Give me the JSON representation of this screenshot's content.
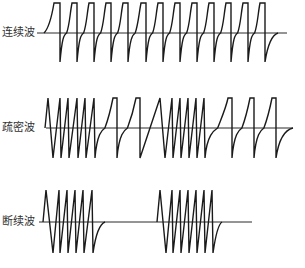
{
  "diagram": {
    "colors": {
      "line": "#1a1a1a",
      "baseline": "#2a2a2a",
      "label": "#333333",
      "background": "#ffffff"
    },
    "waveforms": [
      {
        "id": "continuous",
        "label": "连续波",
        "label_y": 27,
        "baseline": {
          "y": 33,
          "x_start": 37,
          "x_end": 287
        },
        "top": 3,
        "bottom": 62,
        "segments": [
          {
            "type": "lead_rise",
            "x0": 44,
            "x1": 54
          },
          {
            "type": "sparse",
            "drops": [
              60,
              77,
              94,
              111,
              128,
              146,
              163,
              180,
              197,
              214,
              231,
              248,
              265
            ],
            "flat": 5
          },
          {
            "type": "tail",
            "x_end": 278
          }
        ]
      },
      {
        "id": "dense-sparse",
        "label": "疏密波",
        "label_y": 123,
        "baseline": {
          "y": 128,
          "x_start": 46,
          "x_end": 293
        },
        "top": 98,
        "bottom": 158,
        "segments": [
          {
            "type": "dense",
            "x_start": 48,
            "drops": [
              53,
              61,
              69,
              78,
              86,
              95
            ]
          },
          {
            "type": "sparse",
            "drops": [
              117,
              140
            ],
            "flat": 4
          },
          {
            "type": "dense",
            "x_start": 160,
            "drops": [
              165,
              173,
              181,
              189,
              197,
              205
            ]
          },
          {
            "type": "sparse",
            "drops": [
              232,
              254,
              276
            ],
            "flat": 4
          },
          {
            "type": "tail",
            "x_end": 293
          }
        ]
      },
      {
        "id": "intermittent",
        "label": "断续波",
        "label_y": 216,
        "baseline": {
          "y": 222,
          "x_start": 39,
          "x_end": 252
        },
        "top": 190,
        "bottom": 253,
        "segments": [
          {
            "type": "dense",
            "x_start": 46,
            "drops": [
              53,
              60,
              68,
              76,
              84,
              93
            ]
          },
          {
            "type": "tail",
            "x_end": 105
          },
          {
            "type": "gap",
            "x_to": 160
          },
          {
            "type": "dense",
            "x_start": 160,
            "drops": [
              166,
              173,
              181,
              189,
              197,
              205,
              213
            ]
          },
          {
            "type": "tail",
            "x_end": 222
          }
        ]
      }
    ]
  }
}
